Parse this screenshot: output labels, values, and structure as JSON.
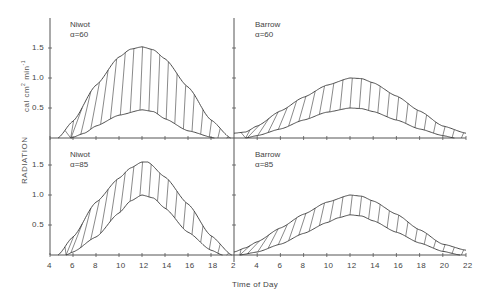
{
  "chart_data": {
    "type": "area",
    "title": "",
    "xlabel": "Time of Day",
    "ylabel": "RADIATION",
    "yunit": "cal cm² min⁻¹",
    "layout": "2x2 panels, shaded band between upper and lower curves (hatched)",
    "panels": [
      {
        "name": "Niwot",
        "alpha_label": "α=60",
        "position": "top-left",
        "xlim": [
          4,
          20
        ],
        "ylim": [
          0,
          2.0
        ],
        "xticks": [
          4,
          6,
          8,
          10,
          12,
          14,
          16,
          18
        ],
        "yticks": [
          0.5,
          1.0,
          1.5
        ],
        "upper": {
          "x": [
            4.7,
            6,
            8,
            10,
            11,
            12,
            13,
            14,
            16,
            18,
            19.7
          ],
          "y": [
            0,
            0.28,
            0.88,
            1.35,
            1.48,
            1.52,
            1.47,
            1.32,
            0.85,
            0.3,
            0
          ]
        },
        "lower": {
          "x": [
            5.8,
            7,
            8,
            10,
            12,
            13,
            14,
            16,
            18.3
          ],
          "y": [
            0,
            0.08,
            0.2,
            0.38,
            0.47,
            0.44,
            0.32,
            0.12,
            0
          ]
        }
      },
      {
        "name": "Barrow",
        "alpha_label": "α=60",
        "position": "top-right",
        "xlim": [
          2,
          22
        ],
        "ylim": [
          0,
          2.0
        ],
        "xticks": [
          2,
          4,
          6,
          8,
          10,
          12,
          14,
          16,
          18,
          20,
          22
        ],
        "upper": {
          "x": [
            2,
            3,
            4,
            6,
            8,
            10,
            12,
            13,
            14,
            16,
            18,
            20,
            22
          ],
          "y": [
            0.08,
            0.1,
            0.2,
            0.45,
            0.68,
            0.88,
            1.0,
            0.99,
            0.92,
            0.7,
            0.45,
            0.2,
            0.08
          ]
        },
        "lower": {
          "x": [
            3,
            4,
            6,
            8,
            10,
            12,
            13,
            14,
            16,
            18,
            20,
            21
          ],
          "y": [
            0,
            0.04,
            0.15,
            0.3,
            0.43,
            0.5,
            0.49,
            0.44,
            0.3,
            0.15,
            0.04,
            0
          ]
        }
      },
      {
        "name": "Niwot",
        "alpha_label": "α=85",
        "position": "bottom-left",
        "xlim": [
          4,
          20
        ],
        "ylim": [
          0,
          2.0
        ],
        "xticks": [
          4,
          6,
          8,
          10,
          12,
          14,
          16,
          18
        ],
        "yticks": [
          0.5,
          1.0,
          1.5
        ],
        "upper": {
          "x": [
            4.7,
            6,
            8,
            10,
            11,
            12,
            12.5,
            14,
            16,
            18,
            19.8
          ],
          "y": [
            0,
            0.3,
            0.88,
            1.28,
            1.45,
            1.55,
            1.55,
            1.3,
            0.85,
            0.32,
            0
          ]
        },
        "lower": {
          "x": [
            5.4,
            6,
            8,
            10,
            11,
            12,
            13,
            14,
            16,
            18,
            19
          ],
          "y": [
            0,
            0.05,
            0.3,
            0.7,
            0.9,
            1.0,
            0.95,
            0.78,
            0.38,
            0.08,
            0
          ]
        }
      },
      {
        "name": "Barrow",
        "alpha_label": "α=85",
        "position": "bottom-right",
        "xlim": [
          2,
          22
        ],
        "ylim": [
          0,
          2.0
        ],
        "xticks": [
          2,
          4,
          6,
          8,
          10,
          12,
          14,
          16,
          18,
          20,
          22
        ],
        "upper": {
          "x": [
            2,
            3,
            4,
            6,
            8,
            10,
            12,
            13,
            14,
            16,
            18,
            20,
            22
          ],
          "y": [
            0.05,
            0.12,
            0.22,
            0.45,
            0.68,
            0.88,
            1.0,
            0.98,
            0.9,
            0.68,
            0.42,
            0.18,
            0.08
          ]
        },
        "lower": {
          "x": [
            2.5,
            4,
            6,
            8,
            10,
            11,
            12,
            13,
            14,
            16,
            18,
            20,
            21.5
          ],
          "y": [
            0,
            0.05,
            0.18,
            0.36,
            0.54,
            0.62,
            0.67,
            0.65,
            0.57,
            0.38,
            0.2,
            0.06,
            0
          ]
        }
      }
    ]
  },
  "labels": {
    "xlabel": "Time of Day",
    "ylabel": "RADIATION",
    "yunit_prefix": "cal cm",
    "yunit_mid": " min",
    "panels": [
      {
        "name": "Niwot",
        "alpha": "α=60"
      },
      {
        "name": "Barrow",
        "alpha": "α=60"
      },
      {
        "name": "Niwot",
        "alpha": "α=85"
      },
      {
        "name": "Barrow",
        "alpha": "α=85"
      }
    ],
    "yticks_top": [
      "1.5",
      "1.0",
      "0.5"
    ],
    "yticks_bottom": [
      "1.5",
      "1.0",
      "0.5"
    ],
    "xticks_left": [
      "4",
      "6",
      "8",
      "10",
      "12",
      "14",
      "16",
      "18"
    ],
    "xticks_right": [
      "2",
      "4",
      "6",
      "8",
      "10",
      "12",
      "14",
      "16",
      "18",
      "20",
      "22"
    ]
  },
  "colors": {
    "line": "#3a3a3a",
    "axis": "#555555",
    "text": "#444444",
    "background": "#ffffff"
  }
}
